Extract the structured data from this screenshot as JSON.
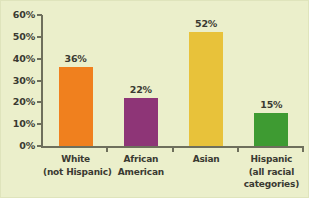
{
  "chart_data": {
    "type": "bar",
    "title": "",
    "xlabel": "",
    "ylabel": "",
    "ylim": [
      0,
      60
    ],
    "ytick_values": [
      0,
      10,
      20,
      30,
      40,
      50,
      60
    ],
    "ytick_labels": [
      "0%",
      "10%",
      "20%",
      "30%",
      "40%",
      "50%",
      "60%"
    ],
    "grid": false,
    "legend": "none",
    "categories": [
      [
        "White",
        "(not Hispanic)"
      ],
      [
        "African",
        "American"
      ],
      [
        "Asian"
      ],
      [
        "Hispanic",
        "(all racial",
        "categories)"
      ]
    ],
    "values": [
      36,
      22,
      52,
      15
    ],
    "value_labels": [
      "36%",
      "22%",
      "52%",
      "15%"
    ],
    "bar_colors": [
      "#f0801e",
      "#8e3577",
      "#e8c23a",
      "#3e9b32"
    ]
  },
  "colors": {
    "background": "#ebefcb",
    "axis": "#6e6f5c",
    "text": "#3a3a32"
  }
}
